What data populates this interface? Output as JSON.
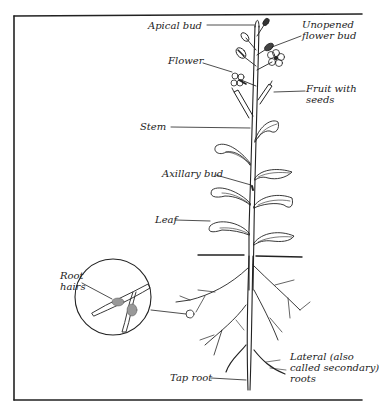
{
  "diagram": {
    "type": "labeled botanical illustration",
    "labels": {
      "apical_bud": "Apical bud",
      "unopened_flower_bud_1": "Unopened",
      "unopened_flower_bud_2": "flower bud",
      "flower": "Flower",
      "fruit_1": "Fruit with",
      "fruit_2": "seeds",
      "stem": "Stem",
      "axillary_bud": "Axillary bud",
      "leaf": "Leaf",
      "root_hairs_1": "Root",
      "root_hairs_2": "hairs",
      "lateral_1": "Lateral (also",
      "lateral_2": "called secondary)",
      "lateral_3": "roots",
      "tap_root": "Tap root"
    },
    "colors": {
      "ink": "#222222",
      "background": "#ffffff"
    }
  }
}
